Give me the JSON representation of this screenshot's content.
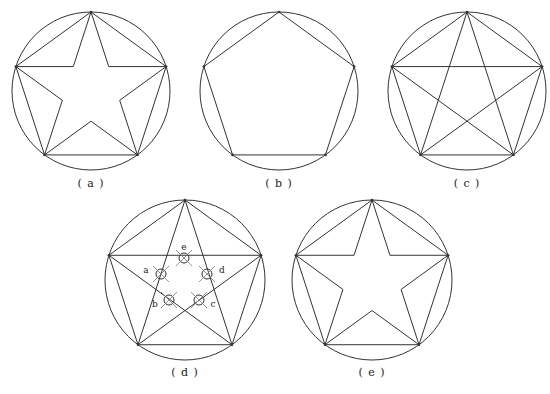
{
  "figures": [
    {
      "id": "a",
      "label": "( a )",
      "type": "star-with-outer-pentagon",
      "cx": 91,
      "cy": 91,
      "r": 79
    },
    {
      "id": "b",
      "label": "( b )",
      "type": "pentagon",
      "cx": 279,
      "cy": 91,
      "r": 79
    },
    {
      "id": "c",
      "label": "( c )",
      "type": "pentagram-with-pentagon",
      "cx": 467,
      "cy": 91,
      "r": 79
    },
    {
      "id": "d",
      "label": "( d )",
      "type": "pentagram-with-pentagon-marked",
      "cx": 185,
      "cy": 280,
      "r": 80
    },
    {
      "id": "e",
      "label": "( e )",
      "type": "star-with-outer-pentagon",
      "cx": 372,
      "cy": 280,
      "r": 80
    }
  ],
  "markers": [
    {
      "letter": "e",
      "x": 184,
      "y": 258
    },
    {
      "letter": "a",
      "x": 161,
      "y": 274
    },
    {
      "letter": "d",
      "x": 207,
      "y": 274
    },
    {
      "letter": "b",
      "x": 169,
      "y": 300
    },
    {
      "letter": "c",
      "x": 199,
      "y": 300
    }
  ],
  "caption": "图 ... 五角星的画法",
  "colors": {
    "stroke": "#333333",
    "background": "#ffffff"
  }
}
